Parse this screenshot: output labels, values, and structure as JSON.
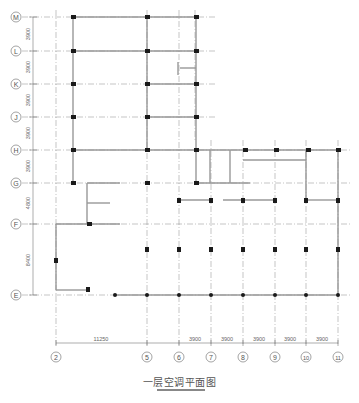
{
  "title": "一层空调平面图",
  "grid_rows": [
    {
      "label": "M",
      "y": 17
    },
    {
      "label": "L",
      "y": 51
    },
    {
      "label": "K",
      "y": 84
    },
    {
      "label": "J",
      "y": 117
    },
    {
      "label": "H",
      "y": 150
    },
    {
      "label": "G",
      "y": 183
    },
    {
      "label": "F",
      "y": 224
    },
    {
      "label": "E",
      "y": 295
    }
  ],
  "row_dims": [
    "3900",
    "3900",
    "3900",
    "3900",
    "3900",
    "4800",
    "8400"
  ],
  "grid_cols": [
    {
      "label": "2",
      "x": 56
    },
    {
      "label": "5",
      "x": 147
    },
    {
      "label": "6",
      "x": 179
    },
    {
      "label": "7",
      "x": 211
    },
    {
      "label": "8",
      "x": 243
    },
    {
      "label": "9",
      "x": 275
    },
    {
      "label": "10",
      "x": 306
    },
    {
      "label": "11",
      "x": 338
    }
  ],
  "col_dims": [
    "11250",
    "3900",
    "3900",
    "3900",
    "3900",
    "3900"
  ],
  "colors": {
    "line": "#9a9a9a",
    "column": "#1a1a1a",
    "axis": "#888888",
    "text": "#555555"
  }
}
